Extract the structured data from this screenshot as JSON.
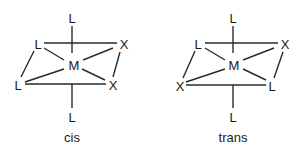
{
  "diagram": {
    "type": "octahedral-isomers",
    "structures": [
      {
        "name": "cis",
        "caption": "cis",
        "atoms": {
          "center": "M",
          "top": "L",
          "bottom": "L",
          "back_left": "L",
          "back_right": "X",
          "front_left": "L",
          "front_right": "X"
        }
      },
      {
        "name": "trans",
        "caption": "trans",
        "atoms": {
          "center": "M",
          "top": "L",
          "bottom": "L",
          "back_left": "L",
          "back_right": "X",
          "front_left": "X",
          "front_right": "L"
        }
      }
    ],
    "colors": {
      "line": "#2a2a2a",
      "text": "#1a1a1a",
      "background": "#ffffff"
    }
  }
}
